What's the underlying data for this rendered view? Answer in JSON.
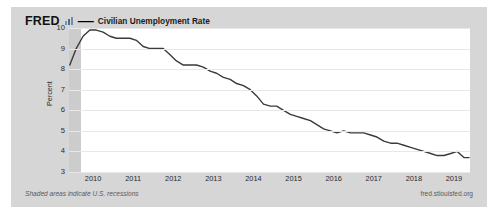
{
  "card": {
    "background_color": "#d6d6d6"
  },
  "header": {
    "logo": "FRED",
    "logo_icon": "fred-chart-glyph",
    "separator": "—",
    "title": "Civilian Unemployment Rate"
  },
  "footer": {
    "note": "Shaded areas indicate U.S. recessions",
    "source": "fred.stlouisfed.org"
  },
  "chart_data": {
    "type": "line",
    "title": "Civilian Unemployment Rate",
    "xlabel": "",
    "ylabel": "Percent",
    "ylim": [
      3,
      10
    ],
    "xlim": [
      2009.4,
      2019.4
    ],
    "grid": true,
    "legend": "none",
    "line_color": "#3a3a3a",
    "yticks": [
      10,
      9,
      8,
      7,
      6,
      5,
      4,
      3
    ],
    "xticks": [
      2010,
      2011,
      2012,
      2013,
      2014,
      2015,
      2016,
      2017,
      2018,
      2019
    ],
    "shaded_regions": [
      {
        "label": "U.S. recession",
        "start": 2009.4,
        "end": 2009.7,
        "color": "#c9c9c9"
      }
    ],
    "series": [
      {
        "name": "Civilian Unemployment Rate",
        "x": [
          2009.42,
          2009.58,
          2009.75,
          2009.92,
          2010.08,
          2010.25,
          2010.42,
          2010.58,
          2010.75,
          2010.92,
          2011.08,
          2011.25,
          2011.42,
          2011.58,
          2011.75,
          2011.92,
          2012.08,
          2012.25,
          2012.42,
          2012.58,
          2012.75,
          2012.92,
          2013.08,
          2013.25,
          2013.42,
          2013.58,
          2013.75,
          2013.92,
          2014.08,
          2014.25,
          2014.42,
          2014.58,
          2014.75,
          2014.92,
          2015.08,
          2015.25,
          2015.42,
          2015.58,
          2015.75,
          2015.92,
          2016.08,
          2016.25,
          2016.42,
          2016.58,
          2016.75,
          2016.92,
          2017.08,
          2017.25,
          2017.42,
          2017.58,
          2017.75,
          2017.92,
          2018.08,
          2018.25,
          2018.42,
          2018.58,
          2018.75,
          2018.92,
          2019.08,
          2019.25,
          2019.38
        ],
        "y": [
          8.2,
          9.0,
          9.6,
          9.9,
          9.9,
          9.8,
          9.6,
          9.5,
          9.5,
          9.5,
          9.4,
          9.1,
          9.0,
          9.0,
          9.0,
          8.7,
          8.4,
          8.2,
          8.2,
          8.2,
          8.1,
          7.9,
          7.8,
          7.6,
          7.5,
          7.3,
          7.2,
          7.0,
          6.7,
          6.3,
          6.2,
          6.2,
          6.0,
          5.8,
          5.7,
          5.6,
          5.5,
          5.3,
          5.1,
          5.0,
          4.9,
          5.0,
          4.9,
          4.9,
          4.9,
          4.8,
          4.7,
          4.5,
          4.4,
          4.4,
          4.3,
          4.2,
          4.1,
          4.0,
          3.9,
          3.8,
          3.8,
          3.9,
          4.0,
          3.7,
          3.7
        ]
      }
    ]
  }
}
